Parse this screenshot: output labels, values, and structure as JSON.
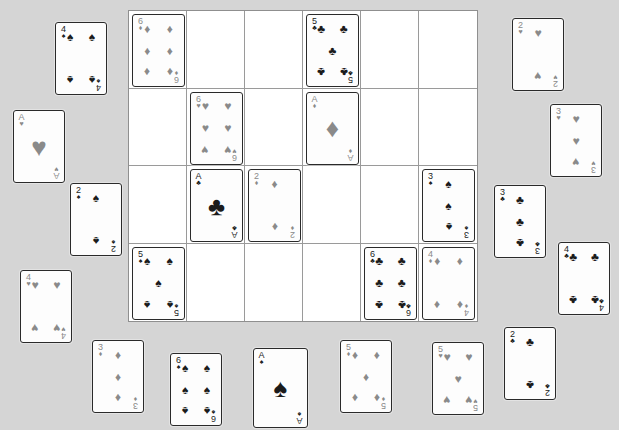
{
  "app": {
    "title": "Card Layout Board",
    "background_color": "#d5d5d5",
    "card_face_color": "#fdfdfd",
    "card_border_color": "#2a2a2a",
    "grid_line_color": "#9a9a9a",
    "black_suit_color": "#1b1b1b",
    "red_suit_color": "#8a8a8a"
  },
  "board": {
    "name": "card-grid",
    "x": 128,
    "y": 10,
    "width": 350,
    "height": 312,
    "rows": 4,
    "cols": 6,
    "cells": [
      {
        "row": 1,
        "col": 1,
        "card": {
          "rank": "6",
          "suit": "diamonds",
          "suit_glyph": "♦",
          "color": "red"
        }
      },
      {
        "row": 1,
        "col": 2,
        "card": null
      },
      {
        "row": 1,
        "col": 3,
        "card": null
      },
      {
        "row": 1,
        "col": 4,
        "card": {
          "rank": "5",
          "suit": "clubs",
          "suit_glyph": "♣",
          "color": "black"
        }
      },
      {
        "row": 1,
        "col": 5,
        "card": null
      },
      {
        "row": 1,
        "col": 6,
        "card": null
      },
      {
        "row": 2,
        "col": 1,
        "card": null
      },
      {
        "row": 2,
        "col": 2,
        "card": {
          "rank": "6",
          "suit": "hearts",
          "suit_glyph": "♥",
          "color": "red"
        }
      },
      {
        "row": 2,
        "col": 3,
        "card": null
      },
      {
        "row": 2,
        "col": 4,
        "card": {
          "rank": "A",
          "suit": "diamonds",
          "suit_glyph": "♦",
          "color": "red"
        }
      },
      {
        "row": 2,
        "col": 5,
        "card": null
      },
      {
        "row": 2,
        "col": 6,
        "card": null
      },
      {
        "row": 3,
        "col": 1,
        "card": null
      },
      {
        "row": 3,
        "col": 2,
        "card": {
          "rank": "A",
          "suit": "clubs",
          "suit_glyph": "♣",
          "color": "black"
        }
      },
      {
        "row": 3,
        "col": 3,
        "card": {
          "rank": "2",
          "suit": "diamonds",
          "suit_glyph": "♦",
          "color": "red"
        }
      },
      {
        "row": 3,
        "col": 4,
        "card": null
      },
      {
        "row": 3,
        "col": 5,
        "card": null
      },
      {
        "row": 3,
        "col": 6,
        "card": {
          "rank": "3",
          "suit": "spades",
          "suit_glyph": "♠",
          "color": "black"
        }
      },
      {
        "row": 4,
        "col": 1,
        "card": {
          "rank": "5",
          "suit": "spades",
          "suit_glyph": "♠",
          "color": "black"
        }
      },
      {
        "row": 4,
        "col": 2,
        "card": null
      },
      {
        "row": 4,
        "col": 3,
        "card": null
      },
      {
        "row": 4,
        "col": 4,
        "card": null
      },
      {
        "row": 4,
        "col": 5,
        "card": {
          "rank": "6",
          "suit": "clubs",
          "suit_glyph": "♣",
          "color": "black"
        }
      },
      {
        "row": 4,
        "col": 6,
        "card": {
          "rank": "4",
          "suit": "diamonds",
          "suit_glyph": "♦",
          "color": "red"
        }
      }
    ]
  },
  "loose_cards": [
    {
      "id": "loose-4-spades",
      "rank": "4",
      "suit": "spades",
      "suit_glyph": "♠",
      "color": "black",
      "x": 55,
      "y": 22,
      "width": 52,
      "height": 73
    },
    {
      "id": "loose-a-hearts",
      "rank": "A",
      "suit": "hearts",
      "suit_glyph": "♥",
      "color": "red",
      "x": 13,
      "y": 110,
      "width": 52,
      "height": 73
    },
    {
      "id": "loose-2-spades",
      "rank": "2",
      "suit": "spades",
      "suit_glyph": "♠",
      "color": "black",
      "x": 70,
      "y": 183,
      "width": 52,
      "height": 73
    },
    {
      "id": "loose-4-hearts",
      "rank": "4",
      "suit": "hearts",
      "suit_glyph": "♥",
      "color": "red",
      "x": 20,
      "y": 270,
      "width": 52,
      "height": 73
    },
    {
      "id": "loose-3-diamonds",
      "rank": "3",
      "suit": "diamonds",
      "suit_glyph": "♦",
      "color": "red",
      "x": 92,
      "y": 340,
      "width": 52,
      "height": 73
    },
    {
      "id": "loose-6-spades",
      "rank": "6",
      "suit": "spades",
      "suit_glyph": "♠",
      "color": "black",
      "x": 170,
      "y": 353,
      "width": 52,
      "height": 73
    },
    {
      "id": "loose-a-spades",
      "rank": "A",
      "suit": "spades",
      "suit_glyph": "♠",
      "color": "black",
      "x": 253,
      "y": 348,
      "width": 55,
      "height": 80
    },
    {
      "id": "loose-5-diamonds",
      "rank": "5",
      "suit": "diamonds",
      "suit_glyph": "♦",
      "color": "red",
      "x": 340,
      "y": 340,
      "width": 52,
      "height": 73
    },
    {
      "id": "loose-5-hearts",
      "rank": "5",
      "suit": "hearts",
      "suit_glyph": "♥",
      "color": "red",
      "x": 432,
      "y": 342,
      "width": 52,
      "height": 73
    },
    {
      "id": "loose-2-clubs",
      "rank": "2",
      "suit": "clubs",
      "suit_glyph": "♣",
      "color": "black",
      "x": 504,
      "y": 327,
      "width": 52,
      "height": 73
    },
    {
      "id": "loose-2-hearts",
      "rank": "2",
      "suit": "hearts",
      "suit_glyph": "♥",
      "color": "red",
      "x": 512,
      "y": 18,
      "width": 52,
      "height": 73
    },
    {
      "id": "loose-3-hearts",
      "rank": "3",
      "suit": "hearts",
      "suit_glyph": "♥",
      "color": "red",
      "x": 550,
      "y": 104,
      "width": 52,
      "height": 73
    },
    {
      "id": "loose-3-clubs",
      "rank": "3",
      "suit": "clubs",
      "suit_glyph": "♣",
      "color": "black",
      "x": 494,
      "y": 185,
      "width": 52,
      "height": 73
    },
    {
      "id": "loose-4-clubs",
      "rank": "4",
      "suit": "clubs",
      "suit_glyph": "♣",
      "color": "black",
      "x": 558,
      "y": 242,
      "width": 52,
      "height": 73
    }
  ],
  "pip_layouts": {
    "A": [
      [
        50,
        50
      ]
    ],
    "2": [
      [
        50,
        14
      ],
      [
        50,
        86
      ]
    ],
    "3": [
      [
        50,
        14
      ],
      [
        50,
        50
      ],
      [
        50,
        86
      ]
    ],
    "4": [
      [
        16,
        14
      ],
      [
        84,
        14
      ],
      [
        16,
        86
      ],
      [
        84,
        86
      ]
    ],
    "5": [
      [
        16,
        14
      ],
      [
        84,
        14
      ],
      [
        50,
        50
      ],
      [
        16,
        86
      ],
      [
        84,
        86
      ]
    ],
    "6": [
      [
        16,
        14
      ],
      [
        84,
        14
      ],
      [
        16,
        50
      ],
      [
        84,
        50
      ],
      [
        16,
        86
      ],
      [
        84,
        86
      ]
    ]
  }
}
